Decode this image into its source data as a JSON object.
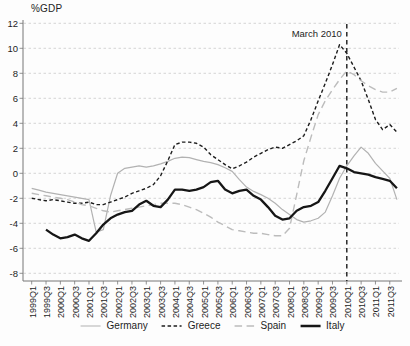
{
  "chart_data": {
    "type": "line",
    "title": "%GDP",
    "xlabel": "",
    "ylabel": "%GDP",
    "ylim": [
      -8,
      12
    ],
    "ytick_step": 2,
    "ytick_labels": [
      "12",
      "10",
      "8",
      "6",
      "4",
      "2",
      "0",
      "-2",
      "-4",
      "-6",
      "-8"
    ],
    "grid": "horizontal-dashed",
    "legend_position": "bottom",
    "x_quarters_start": "1999Q1",
    "x_quarters_end": "2011Q4",
    "xtick_labels": [
      "1999Q1",
      "1999Q3",
      "2000Q1",
      "2000Q3",
      "2001Q1",
      "2001Q3",
      "2002Q1",
      "2002Q3",
      "2003Q1",
      "2003Q3",
      "2004Q1",
      "2004Q3",
      "2005Q1",
      "2005Q3",
      "2006Q1",
      "2006Q3",
      "2007Q1",
      "2007Q3",
      "2008Q1",
      "2008Q3",
      "2009Q1",
      "2009Q3",
      "2010Q1",
      "2010Q3",
      "2011Q1",
      "2011Q3"
    ],
    "annotation": {
      "text": "March 2010",
      "at_quarter_index": 44
    },
    "colors": {
      "axis": "#777777",
      "grid": "#cccccc",
      "text": "#1e1e1e",
      "annotation_line": "#1a1a1a"
    },
    "series": [
      {
        "name": "Germany",
        "line_style": "solid",
        "color": "#b2b2b2",
        "width": 1.2,
        "values": [
          -1.2,
          -1.35,
          -1.5,
          -1.6,
          -1.7,
          -1.8,
          -1.9,
          -2.0,
          -2.1,
          -4.7,
          -4.5,
          -1.8,
          0.0,
          0.4,
          0.5,
          0.6,
          0.5,
          0.6,
          0.75,
          0.95,
          1.2,
          1.3,
          1.25,
          1.1,
          0.95,
          0.85,
          0.7,
          0.45,
          0.15,
          -0.5,
          -1.1,
          -1.45,
          -1.7,
          -2.0,
          -2.4,
          -2.9,
          -3.3,
          -3.7,
          -3.9,
          -3.8,
          -3.6,
          -3.1,
          -1.8,
          -0.4,
          0.6,
          1.4,
          2.1,
          1.6,
          0.8,
          0.2,
          -0.4,
          -2.1
        ]
      },
      {
        "name": "Greece",
        "line_style": "short-dash",
        "color": "#1c1c1c",
        "width": 1.4,
        "values": [
          -2.0,
          -2.1,
          -2.2,
          -2.1,
          -2.2,
          -2.3,
          -2.4,
          -2.4,
          -2.3,
          -2.5,
          -2.5,
          -2.3,
          -2.1,
          -1.9,
          -1.6,
          -1.4,
          -1.2,
          -0.9,
          -0.2,
          1.0,
          2.3,
          2.5,
          2.5,
          2.4,
          2.1,
          1.5,
          1.1,
          0.7,
          0.35,
          0.6,
          0.9,
          1.3,
          1.6,
          1.9,
          2.1,
          2.0,
          2.3,
          2.6,
          3.0,
          4.3,
          5.8,
          7.2,
          8.7,
          10.3,
          9.6,
          8.5,
          7.4,
          5.9,
          4.3,
          3.5,
          3.9,
          3.3
        ]
      },
      {
        "name": "Spain",
        "line_style": "long-dash",
        "color": "#bcbcbc",
        "width": 1.4,
        "values": [
          -1.6,
          -1.7,
          -1.8,
          -1.9,
          -2.0,
          -2.1,
          -2.3,
          -2.5,
          -2.6,
          -2.8,
          -3.0,
          -3.1,
          -3.0,
          -2.9,
          -2.8,
          -2.7,
          -2.6,
          -2.5,
          -2.4,
          -2.4,
          -2.4,
          -2.5,
          -2.7,
          -2.9,
          -3.2,
          -3.5,
          -3.9,
          -4.2,
          -4.5,
          -4.6,
          -4.7,
          -4.8,
          -4.8,
          -4.9,
          -5.0,
          -5.0,
          -4.4,
          -1.7,
          1.0,
          2.9,
          4.7,
          5.8,
          6.7,
          7.5,
          8.2,
          7.9,
          7.4,
          7.0,
          6.7,
          6.5,
          6.5,
          6.8
        ]
      },
      {
        "name": "Italy",
        "line_style": "solid-thick",
        "color": "#161616",
        "width": 2.3,
        "values": [
          null,
          null,
          -4.5,
          -4.9,
          -5.2,
          -5.1,
          -4.9,
          -5.2,
          -5.4,
          -4.8,
          -4.1,
          -3.6,
          -3.3,
          -3.1,
          -3.0,
          -2.5,
          -2.2,
          -2.6,
          -2.7,
          -2.1,
          -1.3,
          -1.3,
          -1.4,
          -1.3,
          -1.1,
          -0.7,
          -0.6,
          -1.3,
          -1.6,
          -1.4,
          -1.3,
          -1.8,
          -2.1,
          -2.7,
          -3.4,
          -3.7,
          -3.6,
          -3.0,
          -2.7,
          -2.6,
          -2.3,
          -1.4,
          -0.4,
          0.6,
          0.4,
          0.1,
          0.0,
          -0.1,
          -0.3,
          -0.45,
          -0.6,
          -1.2
        ]
      }
    ]
  }
}
